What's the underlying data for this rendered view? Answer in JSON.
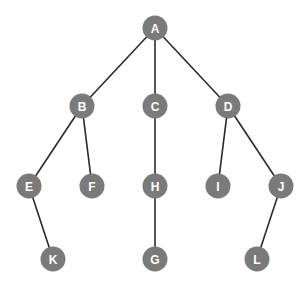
{
  "diagram": {
    "type": "tree",
    "node_color": "#7a7a7a",
    "label_color": "#ffffff",
    "edge_color": "#2a2a2a",
    "nodes": [
      {
        "id": "A",
        "label": "A",
        "x": 155,
        "y": 28
      },
      {
        "id": "B",
        "label": "B",
        "x": 82,
        "y": 106
      },
      {
        "id": "C",
        "label": "C",
        "x": 155,
        "y": 106
      },
      {
        "id": "D",
        "label": "D",
        "x": 228,
        "y": 106
      },
      {
        "id": "E",
        "label": "E",
        "x": 29,
        "y": 186
      },
      {
        "id": "F",
        "label": "F",
        "x": 92,
        "y": 186
      },
      {
        "id": "H",
        "label": "H",
        "x": 155,
        "y": 186
      },
      {
        "id": "I",
        "label": "I",
        "x": 218,
        "y": 186
      },
      {
        "id": "J",
        "label": "J",
        "x": 281,
        "y": 186
      },
      {
        "id": "K",
        "label": "K",
        "x": 53,
        "y": 259
      },
      {
        "id": "G",
        "label": "G",
        "x": 155,
        "y": 259
      },
      {
        "id": "L",
        "label": "L",
        "x": 257,
        "y": 259
      }
    ],
    "edges": [
      [
        "A",
        "B"
      ],
      [
        "A",
        "C"
      ],
      [
        "A",
        "D"
      ],
      [
        "B",
        "E"
      ],
      [
        "B",
        "F"
      ],
      [
        "C",
        "H"
      ],
      [
        "D",
        "I"
      ],
      [
        "D",
        "J"
      ],
      [
        "E",
        "K"
      ],
      [
        "H",
        "G"
      ],
      [
        "J",
        "L"
      ]
    ]
  }
}
